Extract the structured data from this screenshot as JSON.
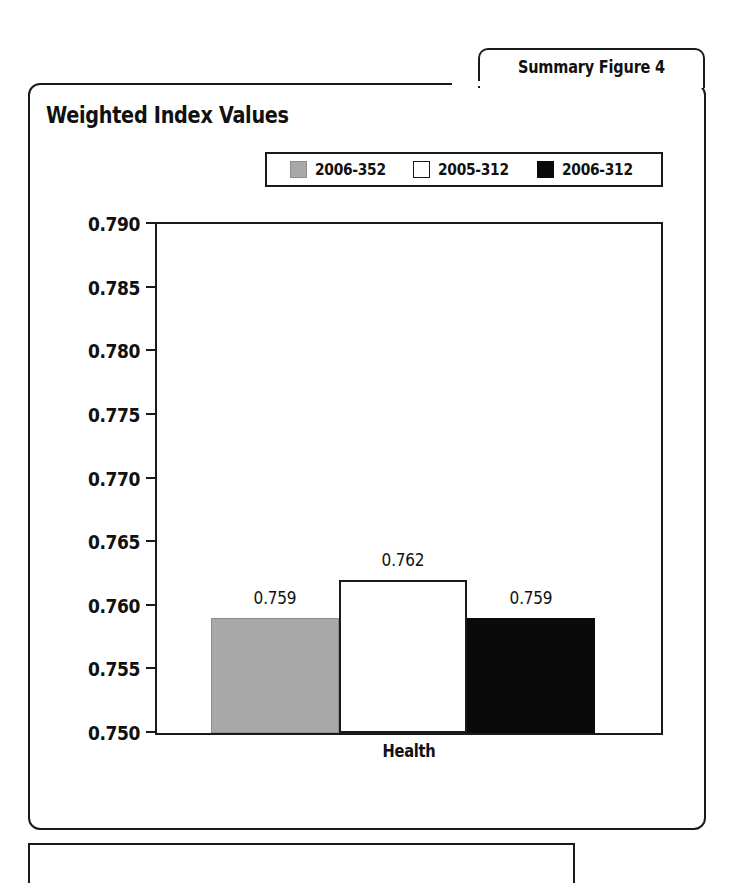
{
  "figure_tab": {
    "label": "Summary Figure 4"
  },
  "chart_title": "Weighted Index Values",
  "xaxis_label": "Health",
  "legend": [
    {
      "label": "2006-352",
      "swatch": "gray-swatch-icon",
      "color": "#a8a8a8"
    },
    {
      "label": "2005-312",
      "swatch": "white-swatch-icon",
      "color": "#ffffff"
    },
    {
      "label": "2006-312",
      "swatch": "black-swatch-icon",
      "color": "#0a0a0a"
    }
  ],
  "chart_data": {
    "type": "bar",
    "title": "Weighted Index Values",
    "xlabel": "Health",
    "ylabel": "",
    "categories": [
      "Health"
    ],
    "ylim": [
      0.75,
      0.79
    ],
    "yticks": [
      "0.750",
      "0.755",
      "0.760",
      "0.765",
      "0.770",
      "0.775",
      "0.780",
      "0.785",
      "0.790"
    ],
    "ytick_values": [
      0.75,
      0.755,
      0.76,
      0.765,
      0.77,
      0.775,
      0.78,
      0.785,
      0.79
    ],
    "grid": false,
    "legend_position": "top",
    "series": [
      {
        "name": "2006-352",
        "values": [
          0.759
        ],
        "labels": [
          "0.759"
        ],
        "color": "#a8a8a8"
      },
      {
        "name": "2005-312",
        "values": [
          0.762
        ],
        "labels": [
          "0.762"
        ],
        "color": "#ffffff"
      },
      {
        "name": "2006-312",
        "values": [
          0.759
        ],
        "labels": [
          "0.759"
        ],
        "color": "#0a0a0a"
      }
    ]
  }
}
